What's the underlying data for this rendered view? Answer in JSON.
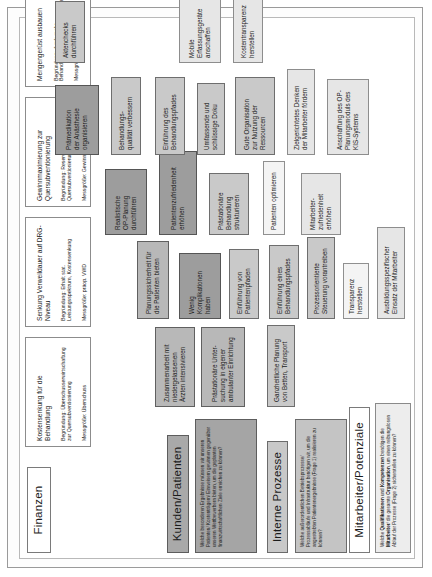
{
  "diagram": {
    "type": "balanced-scorecard-strategy-map",
    "language": "de",
    "orientation": "rotated-90-ccw"
  },
  "perspectives": [
    {
      "id": "finanzen",
      "label": "Finanzen"
    },
    {
      "id": "kunden",
      "label": "Kunden/Patienten"
    },
    {
      "id": "prozesse",
      "label": "Interne Prozesse"
    },
    {
      "id": "mitarbeiter",
      "label": "Mitarbeiter/Potenziale"
    }
  ],
  "finance_cards": [
    {
      "title": "Kostensenkung für die Behandlung",
      "reason": "Begründung: Überschusserwirtschaftung zur Quersubventionierung",
      "measure": "Messgröße: Überschuss"
    },
    {
      "title": "Senkung Verweildauer auf DRG-Niveau",
      "reason": "Begründung: Erhalt stat. Leistungsspektrum, Kostensenkung",
      "measure": "Messgröße: präop. VWD"
    },
    {
      "title": "Gewinnmaximierung zur Quersubventionierung",
      "reason": "Begründung: Reservenbildung und Quersubventionierung",
      "measure": "Messgröße: Gewinn pro Pfad"
    },
    {
      "title": "Mengengerüst ausbauen",
      "reason": "Begründung: durch mehr Behandlungsfälle Gewinne maximieren",
      "measure": "Messgröße: Anzahl Fallpatienten"
    }
  ],
  "questions": {
    "kunden": "Welche besonderen Ergebnisse müssen wir unseren Patienten/ Kostenträgern/ Einweisern gewinnen gegenüber unseren Wettbewerbern bieten, um die geplanten finanzwirtschaftlichen Ziele erreichen zu können?",
    "prozesse": "Welche außerordentlichen Betriebsprozesse/ Prozessabläufe und Infrastruktur benötigen wir, um die angestrebten Patientenergebnisse (Frage 1) realisieren zu können?",
    "mitarbeiter_html": "Welche <b>Qualifikationen</b> und <b>Kompetenzen</b> benötigen die <b>Mitarbeiter</b>/ die gesamte <b>Organisation</b>, um einen reibungslosen Ablauf der Prozesse (Frage 2) sicherstellen zu können?"
  },
  "goals": [
    {
      "id": "zusammenarbeit",
      "label": "Zusammenarbeit mit\nniedergelassenen\nÄrzten intensivieren"
    },
    {
      "id": "praestationaer-unters",
      "label": "Prästationäre Unter-\nsuchung  in eigener\nambulanter Einrichtung"
    },
    {
      "id": "ganzheitliche-planung",
      "label": "Ganzheitliche Planung\nvon Betten, Transport"
    },
    {
      "id": "planungssicherheit",
      "label": "Planungssicherheit für\ndie Patienten bieten"
    },
    {
      "id": "wenig-komplikationen",
      "label": "Wenig\nKomplikationen\nhaben"
    },
    {
      "id": "einfuehrung-pfade",
      "label": "Einführung von\nPatientenpfaden"
    },
    {
      "id": "einfuehrung-bhpfad",
      "label": "Einführung eines\nBehandlungspfades"
    },
    {
      "id": "prozessorientierte",
      "label": "Prozessorientierte\nSteuerung vorantreiben"
    },
    {
      "id": "transparenz",
      "label": "Transparenz\nherstellen"
    },
    {
      "id": "ausbildungsspezifisch",
      "label": "Ausbildungsspezifischer\nEinsatz der Mitarbeiter"
    },
    {
      "id": "realistische-op",
      "label": "Realistische\nOP-Planung\ndurchführen"
    },
    {
      "id": "patientenzufriedenheit",
      "label": "Patientenzufriedenheit\nerhöhen"
    },
    {
      "id": "praestationaer-struct",
      "label": "Prästationäre\nBehandlung\nstrukturieren"
    },
    {
      "id": "patienten-optimieren",
      "label": "Patienten optimieren"
    },
    {
      "id": "praemedikation",
      "label": "Prämedikation\nder Anästhesie\norganisieren"
    },
    {
      "id": "behandlungsqualitaet",
      "label": "Behandlungs-\nqualität verbessern"
    },
    {
      "id": "einfuehrung-bhpfades",
      "label": "Einführung des\nBehandlungspfades"
    },
    {
      "id": "umfassende-doku",
      "label": "Umfassende und\nschlüssige Doku"
    },
    {
      "id": "gute-organisation",
      "label": "Gute Organisation\nzur Nutzung der\nRessourcen"
    },
    {
      "id": "zielgerichtetes",
      "label": "Zielgerichtetes Denken\nder Mitarbeiter fördern"
    },
    {
      "id": "mitarbeiterzufrieden",
      "label": "Mitarbeiter-\nzufriedenheit\nerhöhen"
    },
    {
      "id": "aktenchecks",
      "label": "Aktenchecks\ndurchführen"
    },
    {
      "id": "mobile-erfassung",
      "label": "Mobile\nErfassungsgeräte\nanschaffen"
    },
    {
      "id": "kostentransparenz",
      "label": "Kostentransparenz\nherstellen"
    },
    {
      "id": "anschaffung-kis",
      "label": "Anschaffung des OP-\nPlanungsmoduls des\nKIS-Systems"
    }
  ],
  "colors": {
    "frame": "#9a9a9a",
    "perspective_fill_dark": "#a9a9a9",
    "perspective_fill_light": "#ffffff",
    "chip_dark": "#9d9d9d",
    "chip_mid": "#b8b8b8",
    "chip_grey": "#c9c9c9",
    "chip_light": "#e6e6e6",
    "text": "#1b1b1b"
  }
}
